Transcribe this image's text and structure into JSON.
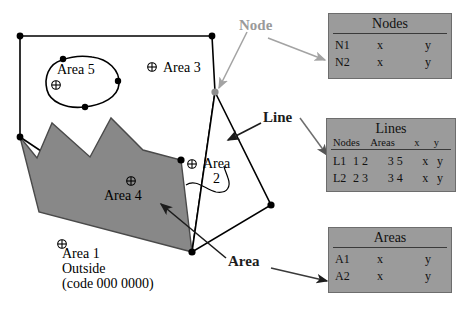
{
  "diagram": {
    "map_labels": [
      {
        "name": "area-5",
        "text": "Area 5"
      },
      {
        "name": "area-3",
        "text": "Area 3"
      },
      {
        "name": "area-2-line1",
        "text": "Area"
      },
      {
        "name": "area-2-line2",
        "text": "2"
      },
      {
        "name": "area-4",
        "text": "Area 4"
      },
      {
        "name": "area-1-line1",
        "text": "Area 1"
      },
      {
        "name": "area-1-line2",
        "text": "Outside"
      },
      {
        "name": "area-1-line3",
        "text": "(code 000 0000)"
      }
    ],
    "labels": {
      "area5": "Area 5",
      "area3": "Area 3",
      "area2_l1": "Area",
      "area2_l2": "2",
      "area4": "Area 4",
      "area1_l1": "Area 1",
      "area1_l2": "Outside",
      "area1_l3": "(code 000 0000)"
    },
    "callouts": {
      "node": "Node",
      "line": "Line",
      "area": "Area"
    },
    "colors": {
      "node_callout": "#9a9a9a",
      "line_callout": "#1c1c1c",
      "area_callout": "#1c1c1c",
      "polygon_fill": "#888888",
      "table_fill": "#9b9b9b",
      "stroke": "#000000"
    },
    "centroid_icon": "crossed-circle-icon"
  },
  "tables": {
    "nodes": {
      "title": "Nodes",
      "rows": [
        {
          "id": "N1",
          "x": "x",
          "y": "y"
        },
        {
          "id": "N2",
          "x": "x",
          "y": "y"
        }
      ]
    },
    "lines": {
      "title": "Lines",
      "subheaders": {
        "nodes": "Nodes",
        "areas": "Areas",
        "x": "x",
        "y": "y"
      },
      "rows": [
        {
          "id": "L1",
          "nodes": "1  2",
          "areas": "3  5",
          "x": "x",
          "y": "y"
        },
        {
          "id": "L2",
          "nodes": "2  3",
          "areas": "3  4",
          "x": "x",
          "y": "y"
        }
      ]
    },
    "areas": {
      "title": "Areas",
      "rows": [
        {
          "id": "A1",
          "x": "x",
          "y": "y"
        },
        {
          "id": "A2",
          "x": "x",
          "y": "y"
        }
      ]
    }
  }
}
